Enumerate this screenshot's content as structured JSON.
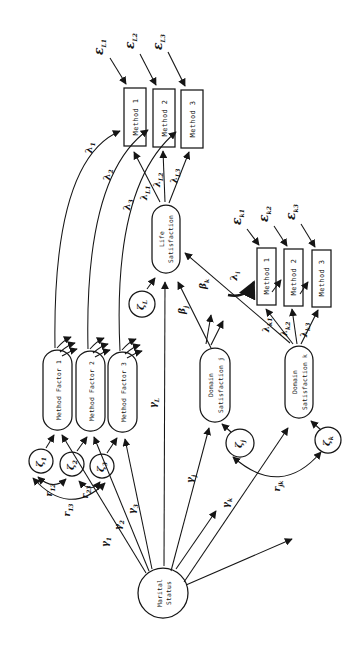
{
  "nodes": {
    "life": {
      "line1": "Life",
      "line2": "Satisfaction"
    },
    "mf1": {
      "label": "Method Factor 1"
    },
    "mf2": {
      "label": "Method Factor 2"
    },
    "mf3": {
      "label": "Method Factor 3"
    },
    "dsj": {
      "line1": "Domain",
      "line2": "Satisfaction j"
    },
    "dsk": {
      "line1": "Domain",
      "line2": "Satisfaction k"
    },
    "marital": {
      "line1": "Marital",
      "line2": "Status"
    },
    "life_methods": [
      "Method 1",
      "Method 2",
      "Method 3"
    ],
    "k_methods": [
      "Method 1",
      "Method 2",
      "Method 3"
    ]
  },
  "labels": {
    "eps_L1": {
      "sym": "ε",
      "sub": "L1"
    },
    "eps_L2": {
      "sym": "ε",
      "sub": "L2"
    },
    "eps_L3": {
      "sym": "ε",
      "sub": "L3"
    },
    "eps_k1": {
      "sym": "ε",
      "sub": "k1"
    },
    "eps_k2": {
      "sym": "ε",
      "sub": "k2"
    },
    "eps_k3": {
      "sym": "ε",
      "sub": "k3"
    },
    "lam_1": {
      "sym": "λ",
      "sub": "1"
    },
    "lam_2": {
      "sym": "λ",
      "sub": "2"
    },
    "lam_3": {
      "sym": "λ",
      "sub": "3"
    },
    "lam_L1": {
      "sym": "λ",
      "sub": "L1"
    },
    "lam_L2": {
      "sym": "λ",
      "sub": "L2"
    },
    "lam_L3": {
      "sym": "λ",
      "sub": "L3"
    },
    "lam_i": {
      "sym": "λ",
      "sub": "i"
    },
    "lam_k1": {
      "sym": "λ",
      "sub": "k1"
    },
    "lam_k2": {
      "sym": "λ",
      "sub": "k2"
    },
    "lam_k3": {
      "sym": "λ",
      "sub": "k3"
    },
    "zeta_1": {
      "sym": "ζ",
      "sub": "1"
    },
    "zeta_2": {
      "sym": "ζ",
      "sub": "2"
    },
    "zeta_3": {
      "sym": "ζ",
      "sub": "3"
    },
    "zeta_L": {
      "sym": "ζ",
      "sub": "L"
    },
    "zeta_j": {
      "sym": "ζ",
      "sub": "j"
    },
    "zeta_k": {
      "sym": "ζ",
      "sub": "k"
    },
    "gamma_1": {
      "sym": "γ",
      "sub": "1"
    },
    "gamma_2": {
      "sym": "γ",
      "sub": "2"
    },
    "gamma_3": {
      "sym": "γ",
      "sub": "3"
    },
    "gamma_L": {
      "sym": "γ",
      "sub": "L"
    },
    "gamma_j": {
      "sym": "γ",
      "sub": "j"
    },
    "gamma_k": {
      "sym": "γ",
      "sub": "k"
    },
    "beta_j": {
      "sym": "β",
      "sub": "j"
    },
    "beta_k": {
      "sym": "β",
      "sub": "k"
    },
    "r_12": {
      "sym": "r",
      "sub": "12"
    },
    "r_23": {
      "sym": "r",
      "sub": "23"
    },
    "r_13": {
      "sym": "r",
      "sub": "13"
    },
    "r_jk": {
      "sym": "r",
      "sub": "jk"
    }
  }
}
